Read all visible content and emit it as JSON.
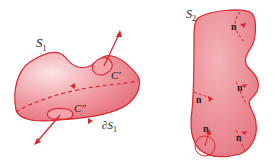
{
  "diagram": {
    "surface1": {
      "label": "S",
      "label_sub": "1",
      "boundary_label": "∂S",
      "boundary_sub": "1",
      "curve_top": "C′",
      "curve_bottom": "C″"
    },
    "surface2": {
      "label": "S",
      "label_sub": "2",
      "normals": [
        "n",
        "n",
        "n",
        "n",
        "n"
      ]
    },
    "colors": {
      "fill": "#ec8a93",
      "fill_light": "#f6c6cb",
      "stroke": "#d9262f",
      "text": "#222222"
    }
  }
}
